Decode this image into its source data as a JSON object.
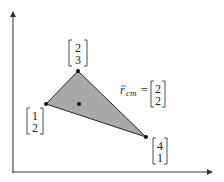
{
  "diagram": {
    "colors": {
      "axis": "#333333",
      "fill": "#a9a9a9",
      "edge": "#222222",
      "point": "#111111"
    },
    "vertices": [
      {
        "id": "v1",
        "vector": [
          "1",
          "2"
        ],
        "px": [
          46,
          104
        ]
      },
      {
        "id": "v2",
        "vector": [
          "2",
          "3"
        ],
        "px": [
          78,
          71
        ]
      },
      {
        "id": "v3",
        "vector": [
          "4",
          "1"
        ],
        "px": [
          146,
          137
        ]
      }
    ],
    "centroid": {
      "label_symbol": "r",
      "label_sub": "cm",
      "equals": "=",
      "vector": [
        "2",
        "2"
      ],
      "px": [
        79,
        104
      ]
    }
  }
}
